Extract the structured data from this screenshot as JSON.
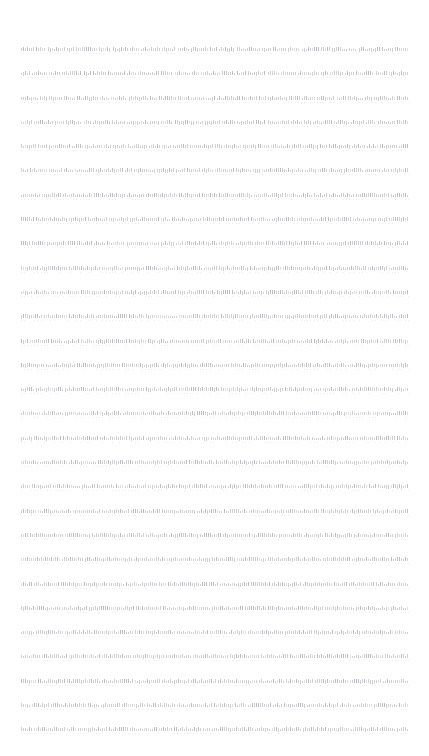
{
  "document": {
    "page": {
      "width_px": 429,
      "height_px": 756,
      "background_color": "#ffffff"
    },
    "text_block": {
      "left_px": 21,
      "right_px": 409,
      "column_width_px": 388,
      "first_line_y_px": 48,
      "last_line_y_px": 723,
      "line_spacing_px": 24.3,
      "alignment": "justified",
      "legibility": "illegible",
      "ink_color": "#cfcfd6",
      "ink_color_darkest": "#bcbcc6",
      "ink_color_faintest": "#e9e9ee",
      "line_count": 29
    },
    "lines": [
      {
        "id": 1,
        "text": "",
        "words": [
          7,
          5,
          9,
          4,
          11,
          6,
          8,
          5,
          10,
          7,
          6,
          9,
          4,
          8,
          12,
          5,
          7,
          6,
          9,
          5,
          8,
          4,
          11,
          6,
          7
        ]
      },
      {
        "id": 2,
        "text": "",
        "words": [
          5,
          8,
          6,
          10,
          4,
          7,
          9,
          5,
          11,
          6,
          8,
          4,
          10,
          7,
          5,
          9,
          6,
          8,
          11,
          4,
          7,
          5,
          9,
          6,
          10
        ]
      },
      {
        "id": 3,
        "text": "",
        "words": [
          9,
          4,
          7,
          6,
          11,
          5,
          8,
          10,
          4,
          9,
          6,
          7,
          5,
          12,
          8,
          4,
          10,
          6,
          7,
          9,
          5,
          8,
          4,
          11,
          6
        ]
      },
      {
        "id": 4,
        "text": "",
        "words": [
          6,
          10,
          5,
          8,
          4,
          9,
          7,
          11,
          5,
          6,
          10,
          4,
          8,
          7,
          9,
          5,
          11,
          6,
          4,
          10,
          8,
          7,
          5,
          9,
          6
        ]
      },
      {
        "id": 5,
        "text": "",
        "words": [
          8,
          5,
          11,
          6,
          9,
          4,
          7,
          10,
          6,
          5,
          8,
          12,
          4,
          9,
          7,
          6,
          10,
          5,
          8,
          4,
          11,
          7,
          6,
          9,
          5
        ]
      },
      {
        "id": 6,
        "text": "",
        "words": [
          4,
          9,
          7,
          5,
          10,
          6,
          8,
          4,
          11,
          9,
          5,
          7,
          6,
          10,
          8,
          4,
          9,
          12,
          6,
          5,
          7,
          10,
          8,
          4,
          9
        ]
      },
      {
        "id": 7,
        "text": "",
        "words": [
          10,
          6,
          4,
          8,
          7,
          11,
          5,
          9,
          6,
          10,
          4,
          7,
          8,
          5,
          12,
          9,
          6,
          4,
          10,
          7,
          5,
          8,
          11,
          6,
          9
        ]
      },
      {
        "id": 8,
        "text": "",
        "words": [
          7,
          11,
          5,
          9,
          6,
          4,
          10,
          8,
          7,
          5,
          9,
          6,
          11,
          4,
          8,
          10,
          5,
          7,
          6,
          9,
          12,
          4,
          8,
          5,
          10
        ]
      },
      {
        "id": 9,
        "text": "",
        "words": [
          5,
          7,
          10,
          4,
          8,
          6,
          9,
          11,
          5,
          7,
          4,
          10,
          6,
          8,
          9,
          5,
          11,
          7,
          4,
          6,
          10,
          8,
          9,
          5,
          7
        ]
      },
      {
        "id": 10,
        "text": "",
        "words": [
          9,
          6,
          8,
          5,
          11,
          7,
          4,
          10,
          9,
          6,
          5,
          8,
          7,
          11,
          4,
          10,
          6,
          9,
          5,
          8,
          7,
          12,
          4,
          6,
          10
        ]
      },
      {
        "id": 11,
        "text": "",
        "words": [
          6,
          8,
          4,
          10,
          5,
          9,
          7,
          6,
          11,
          8,
          4,
          9,
          5,
          7,
          10,
          6,
          8,
          11,
          5,
          4,
          9,
          7,
          6,
          10,
          8
        ]
      },
      {
        "id": 12,
        "text": "",
        "words": [
          11,
          5,
          7,
          9,
          4,
          6,
          10,
          8,
          5,
          11,
          7,
          4,
          9,
          6,
          8,
          12,
          5,
          10,
          7,
          4,
          6,
          9,
          8,
          11,
          5
        ]
      },
      {
        "id": 13,
        "text": "",
        "words": [
          4,
          10,
          6,
          8,
          7,
          5,
          11,
          9,
          4,
          6,
          10,
          7,
          8,
          5,
          9,
          11,
          6,
          4,
          8,
          10,
          7,
          5,
          9,
          6,
          8
        ]
      },
      {
        "id": 14,
        "text": "",
        "words": [
          8,
          4,
          9,
          6,
          10,
          5,
          7,
          11,
          8,
          4,
          6,
          9,
          10,
          5,
          7,
          8,
          12,
          4,
          9,
          6,
          11,
          7,
          5,
          8,
          10
        ]
      },
      {
        "id": 15,
        "text": "",
        "words": [
          7,
          9,
          5,
          11,
          4,
          8,
          6,
          10,
          7,
          9,
          5,
          4,
          11,
          8,
          6,
          10,
          7,
          5,
          9,
          4,
          8,
          6,
          11,
          10,
          7
        ]
      },
      {
        "id": 16,
        "text": "",
        "words": [
          10,
          7,
          4,
          8,
          9,
          6,
          5,
          11,
          10,
          7,
          8,
          4,
          6,
          9,
          5,
          12,
          7,
          10,
          8,
          6,
          4,
          9,
          5,
          7,
          11
        ]
      },
      {
        "id": 17,
        "text": "",
        "words": [
          6,
          5,
          9,
          7,
          11,
          10,
          4,
          8,
          6,
          5,
          9,
          7,
          4,
          11,
          10,
          8,
          6,
          9,
          5,
          7,
          4,
          12,
          8,
          10,
          6
        ]
      },
      {
        "id": 18,
        "text": "",
        "words": [
          9,
          8,
          6,
          4,
          10,
          7,
          11,
          5,
          9,
          8,
          4,
          6,
          7,
          10,
          11,
          5,
          8,
          9,
          6,
          4,
          7,
          10,
          5,
          11,
          8
        ]
      },
      {
        "id": 19,
        "text": "",
        "words": [
          5,
          10,
          8,
          6,
          7,
          9,
          4,
          11,
          5,
          10,
          6,
          8,
          9,
          7,
          4,
          11,
          5,
          6,
          10,
          8,
          9,
          7,
          4,
          6,
          9
        ]
      },
      {
        "id": 20,
        "text": "",
        "words": [
          8,
          6,
          11,
          9,
          5,
          4,
          10,
          7,
          8,
          6,
          11,
          9,
          4,
          5,
          7,
          10,
          8,
          11,
          6,
          9,
          5,
          4,
          7,
          8,
          10
        ]
      },
      {
        "id": 21,
        "text": "",
        "words": [
          4,
          7,
          10,
          5,
          8,
          11,
          6,
          9,
          4,
          7,
          10,
          5,
          11,
          8,
          6,
          9,
          4,
          7,
          5,
          10,
          8,
          6,
          11,
          9,
          7
        ]
      },
      {
        "id": 22,
        "text": "",
        "words": [
          11,
          9,
          7,
          4,
          6,
          8,
          10,
          5,
          11,
          9,
          7,
          6,
          4,
          8,
          10,
          5,
          9,
          11,
          7,
          6,
          8,
          4,
          10,
          5,
          9
        ]
      },
      {
        "id": 23,
        "text": "",
        "words": [
          6,
          4,
          9,
          11,
          7,
          5,
          8,
          10,
          6,
          4,
          9,
          11,
          5,
          7,
          8,
          10,
          6,
          9,
          4,
          11,
          7,
          8,
          5,
          10,
          6
        ]
      },
      {
        "id": 24,
        "text": "",
        "words": [
          9,
          11,
          5,
          8,
          10,
          6,
          7,
          4,
          9,
          11,
          8,
          5,
          10,
          6,
          4,
          7,
          9,
          8,
          11,
          5,
          10,
          6,
          7,
          4,
          9
        ]
      },
      {
        "id": 25,
        "text": "",
        "words": [
          7,
          8,
          6,
          10,
          4,
          9,
          11,
          5,
          7,
          8,
          6,
          10,
          9,
          4,
          5,
          11,
          7,
          6,
          8,
          10,
          4,
          9,
          11,
          5,
          7
        ]
      },
      {
        "id": 26,
        "text": "",
        "words": [
          10,
          5,
          8,
          7,
          9,
          11,
          4,
          6,
          10,
          5,
          8,
          7,
          11,
          9,
          6,
          4,
          10,
          8,
          5,
          7,
          9,
          11,
          6,
          4,
          8
        ]
      },
      {
        "id": 27,
        "text": "",
        "words": [
          8,
          10,
          4,
          6,
          11,
          7,
          9,
          5,
          8,
          10,
          4,
          6,
          7,
          11,
          9,
          5,
          8,
          4,
          10,
          6,
          11,
          7,
          9,
          5,
          8
        ]
      },
      {
        "id": 28,
        "text": "",
        "words": [
          5,
          9,
          11,
          7,
          6,
          10,
          8,
          4,
          5,
          9,
          11,
          7,
          10,
          6,
          4,
          8,
          5,
          11,
          9,
          7,
          6,
          10,
          8,
          4,
          5
        ]
      },
      {
        "id": 29,
        "text": "",
        "words": [
          6,
          7,
          9,
          5,
          11,
          4,
          10,
          8,
          6,
          7,
          9,
          5,
          4,
          11,
          10,
          8,
          6,
          9,
          7,
          5,
          11,
          4,
          10,
          8,
          6
        ]
      }
    ]
  }
}
